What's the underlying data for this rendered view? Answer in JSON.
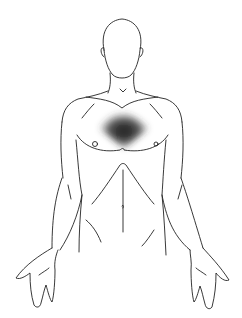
{
  "figure": {
    "highlight_region": "center chest",
    "colors": {
      "background": "#ffffff",
      "outline": "#222222",
      "highlight": "#1a1a1a"
    }
  }
}
